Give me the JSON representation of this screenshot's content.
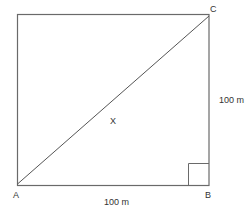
{
  "diagram": {
    "shape": "square",
    "colors": {
      "line": "#555555",
      "text": "#333333",
      "background": "#ffffff"
    },
    "vertices": {
      "A": {
        "label": "A"
      },
      "B": {
        "label": "B"
      },
      "C": {
        "label": "C"
      }
    },
    "point_on_diagonal": {
      "label": "X"
    },
    "dimensions": {
      "bottom_side": "100 m",
      "right_side": "100 m"
    },
    "right_angle_marker": "B"
  }
}
